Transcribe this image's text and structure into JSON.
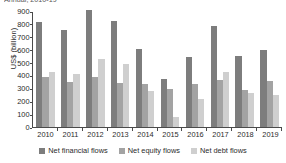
{
  "figure": {
    "clipped_title_fragment": "Annual, 2010-19"
  },
  "chart_data": {
    "type": "bar",
    "title": "",
    "xlabel": "",
    "ylabel": "US$ (billion)",
    "ylim": [
      0,
      900
    ],
    "ytick_step": 100,
    "yticks": [
      "900",
      "800",
      "700",
      "600",
      "500",
      "400",
      "300",
      "200",
      "100",
      "0"
    ],
    "grid": false,
    "legend_position": "bottom",
    "categories": [
      "2010",
      "2011",
      "2012",
      "2013",
      "2014",
      "2015",
      "2016",
      "2017",
      "2018",
      "2019"
    ],
    "series": [
      {
        "name": "Net financial flows",
        "color": "#7d7d7d",
        "values": [
          812,
          750,
          905,
          826,
          604,
          370,
          540,
          782,
          548,
          600
        ]
      },
      {
        "name": "Net equity flows",
        "color": "#a3a3a3",
        "values": [
          385,
          346,
          387,
          340,
          332,
          296,
          334,
          362,
          291,
          359
        ]
      },
      {
        "name": "Net debt flows",
        "color": "#cfcfcf",
        "values": [
          425,
          408,
          525,
          490,
          281,
          80,
          215,
          430,
          266,
          247
        ]
      }
    ]
  }
}
